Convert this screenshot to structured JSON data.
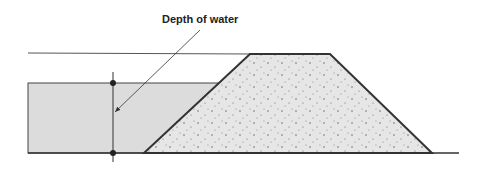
{
  "diagram": {
    "title_label": "Depth of water",
    "elements": {
      "water": {
        "color": "#d9d9d9"
      },
      "embankment": {
        "fill": "#e6e6e6",
        "stroke": "#333333",
        "texture": "stippled"
      },
      "lines": {
        "color": "#444444"
      }
    }
  }
}
